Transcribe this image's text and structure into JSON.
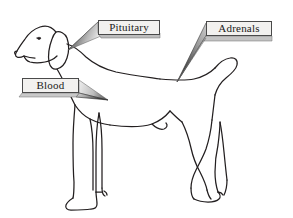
{
  "figure": {
    "orientation": "facing-left",
    "background_color": "#ffffff",
    "line_color": "#231f20",
    "callouts": [
      {
        "id": "pituitary",
        "label": "Pituitary",
        "target": "head-brain",
        "box": {
          "x": 98,
          "y": 20,
          "w": 62,
          "h": 15
        },
        "pointer_tip": {
          "x": 68,
          "y": 50
        },
        "pointer_fill": "gradient-gray",
        "box_fill": "#f2f1ef",
        "box_border": "#4a4a4a"
      },
      {
        "id": "adrenals",
        "label": "Adrenals",
        "target": "lower-back-kidney",
        "box": {
          "x": 206,
          "y": 21,
          "w": 66,
          "h": 15
        },
        "pointer_tip": {
          "x": 177,
          "y": 82
        },
        "pointer_fill": "gradient-gray",
        "box_fill": "#f2f1ef",
        "box_border": "#4a4a4a"
      },
      {
        "id": "blood",
        "label": "Blood",
        "target": "neck-chest",
        "box": {
          "x": 22,
          "y": 78,
          "w": 57,
          "h": 15
        },
        "pointer_tip": {
          "x": 108,
          "y": 100
        },
        "pointer_fill": "gradient-gray",
        "box_fill": "#f2f1ef",
        "box_border": "#4a4a4a"
      }
    ],
    "icons": {
      "pituitary_pointer": "cone-pointer-icon",
      "adrenals_pointer": "cone-pointer-icon",
      "blood_pointer": "cone-pointer-icon",
      "dog": "dog-outline-icon"
    }
  }
}
